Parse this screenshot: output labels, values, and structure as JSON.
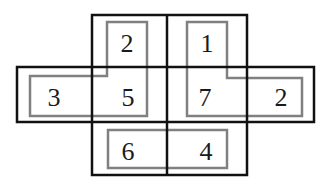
{
  "diagram": {
    "type": "number-grid-puzzle",
    "colors": {
      "outer_line": "#111111",
      "inner_line": "#808080",
      "background": "#ffffff",
      "text": "#1a1a1a"
    },
    "cells": [
      {
        "id": "top-left",
        "value": "2"
      },
      {
        "id": "top-right",
        "value": "1"
      },
      {
        "id": "mid-far-left",
        "value": "3"
      },
      {
        "id": "mid-left",
        "value": "5"
      },
      {
        "id": "mid-right",
        "value": "7"
      },
      {
        "id": "mid-far-right",
        "value": "2"
      },
      {
        "id": "bottom-left",
        "value": "6"
      },
      {
        "id": "bottom-right",
        "value": "4"
      }
    ],
    "groups": [
      {
        "id": "left-l-shape",
        "cells": [
          "2",
          "3",
          "5"
        ]
      },
      {
        "id": "right-l-shape",
        "cells": [
          "1",
          "7",
          "2"
        ]
      },
      {
        "id": "bottom-rect",
        "cells": [
          "6",
          "4"
        ]
      }
    ]
  }
}
